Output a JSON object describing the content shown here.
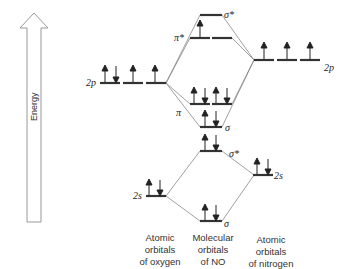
{
  "diagram": {
    "axis": {
      "label": "Energy",
      "direction": "up"
    },
    "columns": {
      "oxygen": {
        "line1": "Atomic",
        "line2": "orbitals",
        "line3": "of oxygen"
      },
      "molecule": {
        "line1": "Molecular",
        "line2": "orbitals",
        "line3": "of NO"
      },
      "nitrogen": {
        "line1": "Atomic",
        "line2": "orbitals",
        "line3": "of nitrogen"
      }
    },
    "levels": {
      "o_2p": {
        "label": "2p",
        "electrons": [
          "up-down",
          "up",
          "up"
        ]
      },
      "n_2p": {
        "label": "2p",
        "electrons": [
          "up",
          "up",
          "up"
        ]
      },
      "sigma_star_2p": {
        "label": "σ*",
        "electrons": [
          ""
        ]
      },
      "pi_star_2p": {
        "label": "π*",
        "electrons": [
          "up",
          ""
        ]
      },
      "pi_2p": {
        "label": "π",
        "electrons": [
          "up-down",
          "up-down"
        ]
      },
      "sigma_2p": {
        "label": "σ",
        "electrons": [
          "up-down"
        ]
      },
      "sigma_star_2s": {
        "label": "σ*",
        "electrons": [
          "up-down"
        ]
      },
      "n_2s": {
        "label": "2s",
        "electrons": [
          "up-down"
        ]
      },
      "o_2s": {
        "label": "2s",
        "electrons": [
          "up-down"
        ]
      },
      "sigma_2s": {
        "label": "σ",
        "electrons": [
          "up-down"
        ]
      }
    },
    "colors": {
      "line": "#555555",
      "level": "#333333",
      "arrow_outline": "#888888"
    }
  }
}
